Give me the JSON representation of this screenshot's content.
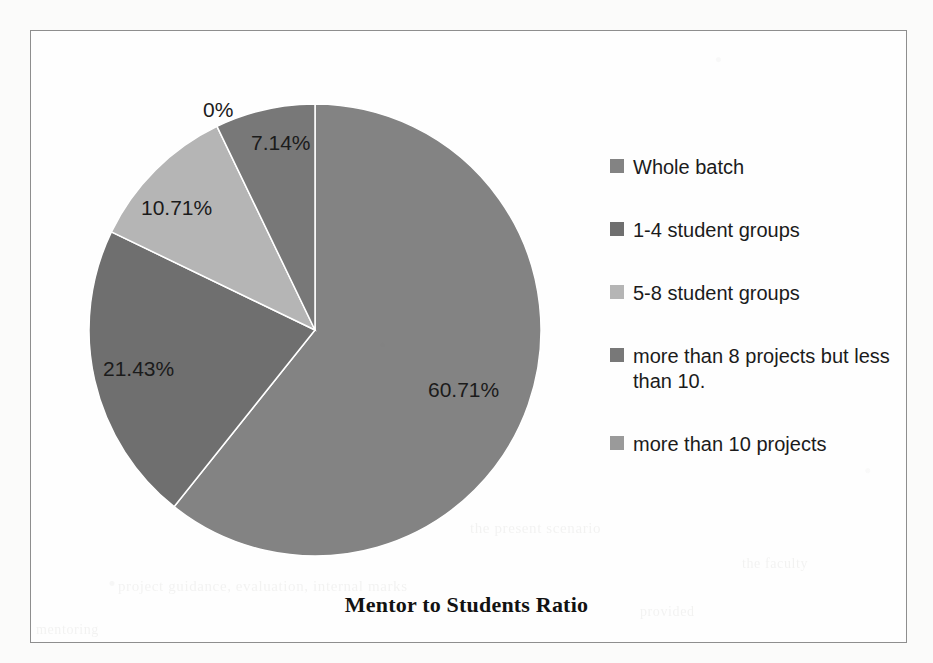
{
  "chart_data": {
    "type": "pie",
    "title": "Mentor to Students Ratio",
    "legend_position": "right",
    "categories": [
      "Whole batch",
      "1-4 student groups",
      "5-8 student groups",
      "more than 8 projects but less than 10.",
      "more than 10 projects"
    ],
    "values": [
      60.71,
      21.43,
      10.71,
      7.14,
      0
    ],
    "value_labels": [
      "60.71%",
      "21.43%",
      "10.71%",
      "7.14%",
      "0%"
    ],
    "unit": "%",
    "colors": [
      "#838383",
      "#6f6f6f",
      "#b5b5b5",
      "#787878",
      "#9a9a9a"
    ],
    "start_angle_deg": 0,
    "direction": "clockwise",
    "total": 100
  },
  "frame": {
    "border_color": "#8e8e8e",
    "background": "#ffffff"
  },
  "slice_labels": [
    {
      "text": "60.71%",
      "left": "428px",
      "top": "378px"
    },
    {
      "text": "21.43%",
      "left": "103px",
      "top": "357px"
    },
    {
      "text": "10.71%",
      "left": "141px",
      "top": "196px"
    },
    {
      "text": "7.14%",
      "left": "251px",
      "top": "131px"
    },
    {
      "text": "0%",
      "left": "203px",
      "top": "98px"
    }
  ],
  "legend": {
    "items": [
      {
        "label": "Whole batch",
        "color": "#838383"
      },
      {
        "label": "1-4 student groups",
        "color": "#6f6f6f"
      },
      {
        "label": "5-8 student groups",
        "color": "#b5b5b5"
      },
      {
        "label": "more than 8 projects but less than 10.",
        "color": "#787878"
      },
      {
        "label": "more than 10 projects",
        "color": "#9a9a9a"
      }
    ]
  },
  "background_bleed": [
    {
      "text": "the present scenario",
      "left": "470px",
      "top": "520px",
      "size": "15px"
    },
    {
      "text": "project guidance, evaluation, internal marks",
      "left": "118px",
      "top": "578px",
      "size": "15px"
    },
    {
      "text": "provided",
      "left": "640px",
      "top": "604px",
      "size": "14px"
    },
    {
      "text": "mentoring",
      "left": "36px",
      "top": "622px",
      "size": "14px"
    },
    {
      "text": "the faculty",
      "left": "742px",
      "top": "556px",
      "size": "14px"
    }
  ]
}
